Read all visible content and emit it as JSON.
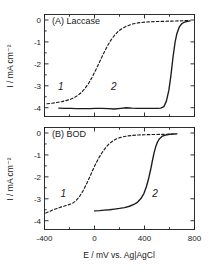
{
  "figure": {
    "background": "#ffffff",
    "line_color": "#1a1a1a"
  },
  "chart_data": [
    {
      "type": "line",
      "panel_id": "A",
      "title": "(A) Laccase",
      "xlabel": "E / mV vs. Ag|AgCl",
      "ylabel": "I / mA cm⁻²",
      "xlim": [
        -400,
        800
      ],
      "ylim": [
        -4.4,
        0.25
      ],
      "xticks": [
        -400,
        0,
        400,
        800
      ],
      "xtick_labels": [
        "-400",
        "0",
        "400",
        "800"
      ],
      "xminorticks": [
        -200,
        200,
        600
      ],
      "yticks": [
        0,
        -1,
        -2,
        -3,
        -4
      ],
      "ytick_labels": [
        "0",
        "-1",
        "-2",
        "-3",
        "-4"
      ],
      "grid": false,
      "legend": "none",
      "series": [
        {
          "name": "1",
          "style": "dashed",
          "annotation": "1",
          "annotation_xy": [
            -270,
            -3.18
          ],
          "x": [
            -380,
            -350,
            -320,
            -290,
            -260,
            -230,
            -200,
            -170,
            -140,
            -110,
            -80,
            -50,
            -20,
            10,
            40,
            70,
            100,
            130,
            160,
            190,
            220,
            250,
            300,
            350,
            400,
            450,
            500,
            560,
            620,
            680,
            730,
            760
          ],
          "y": [
            -3.82,
            -3.8,
            -3.78,
            -3.75,
            -3.72,
            -3.68,
            -3.63,
            -3.56,
            -3.46,
            -3.33,
            -3.15,
            -2.92,
            -2.62,
            -2.28,
            -1.92,
            -1.56,
            -1.22,
            -0.93,
            -0.7,
            -0.52,
            -0.39,
            -0.3,
            -0.19,
            -0.13,
            -0.1,
            -0.08,
            -0.07,
            -0.06,
            -0.05,
            -0.04,
            -0.03,
            -0.02
          ]
        },
        {
          "name": "2",
          "style": "solid",
          "annotation": "2",
          "annotation_xy": [
            155,
            -3.18
          ],
          "x": [
            -285,
            -240,
            -190,
            -140,
            -90,
            -40,
            10,
            60,
            110,
            160,
            210,
            255,
            300,
            345,
            380,
            420,
            460,
            500,
            530,
            555,
            575,
            595,
            612,
            628,
            645,
            660,
            680,
            700,
            720,
            745,
            765
          ],
          "y": [
            -4.02,
            -4.03,
            -4.03,
            -4.04,
            -4.04,
            -4.04,
            -4.03,
            -4.03,
            -4.04,
            -4.06,
            -4.03,
            -4.0,
            -4.02,
            -4.03,
            -4.03,
            -4.03,
            -4.03,
            -4.03,
            -4.02,
            -3.95,
            -3.7,
            -3.2,
            -2.5,
            -1.7,
            -1.0,
            -0.6,
            -0.3,
            -0.16,
            -0.1,
            -0.06,
            -0.04
          ]
        }
      ]
    },
    {
      "type": "line",
      "panel_id": "B",
      "title": "(B) BOD",
      "xlabel": "E / mV vs. Ag|AgCl",
      "ylabel": "I / mA cm⁻²",
      "xlim": [
        -400,
        800
      ],
      "ylim": [
        -4.4,
        0.25
      ],
      "xticks": [
        -400,
        0,
        400,
        800
      ],
      "xtick_labels": [
        "-400",
        "0",
        "400",
        "800"
      ],
      "xminorticks": [
        -200,
        200,
        600
      ],
      "yticks": [
        0,
        -1,
        -2,
        -3,
        -4
      ],
      "ytick_labels": [
        "0",
        "-1",
        "-2",
        "-3",
        "-4"
      ],
      "grid": false,
      "legend": "none",
      "series": [
        {
          "name": "1",
          "style": "dashed",
          "annotation": "1",
          "annotation_xy": [
            -250,
            -2.92
          ],
          "x": [
            -390,
            -360,
            -330,
            -300,
            -270,
            -240,
            -210,
            -180,
            -150,
            -120,
            -90,
            -60,
            -30,
            0,
            30,
            60,
            90,
            120,
            150,
            180,
            210,
            250,
            300,
            350,
            400,
            450,
            500,
            560,
            620,
            660
          ],
          "y": [
            -3.65,
            -3.58,
            -3.5,
            -3.44,
            -3.38,
            -3.33,
            -3.28,
            -3.22,
            -3.1,
            -2.9,
            -2.62,
            -2.28,
            -1.9,
            -1.52,
            -1.18,
            -0.9,
            -0.66,
            -0.48,
            -0.35,
            -0.26,
            -0.2,
            -0.15,
            -0.11,
            -0.09,
            -0.08,
            -0.07,
            -0.07,
            -0.06,
            -0.05,
            -0.04
          ]
        },
        {
          "name": "2",
          "style": "solid",
          "annotation": "2",
          "annotation_xy": [
            485,
            -2.92
          ],
          "x": [
            0,
            40,
            80,
            120,
            160,
            200,
            240,
            280,
            315,
            345,
            370,
            395,
            415,
            432,
            448,
            462,
            476,
            490,
            505,
            520,
            540,
            560,
            590,
            620,
            650
          ],
          "y": [
            -3.55,
            -3.54,
            -3.52,
            -3.5,
            -3.47,
            -3.44,
            -3.4,
            -3.34,
            -3.26,
            -3.15,
            -3.0,
            -2.76,
            -2.45,
            -2.1,
            -1.7,
            -1.3,
            -0.92,
            -0.62,
            -0.4,
            -0.26,
            -0.16,
            -0.11,
            -0.07,
            -0.05,
            -0.04
          ]
        }
      ]
    }
  ]
}
